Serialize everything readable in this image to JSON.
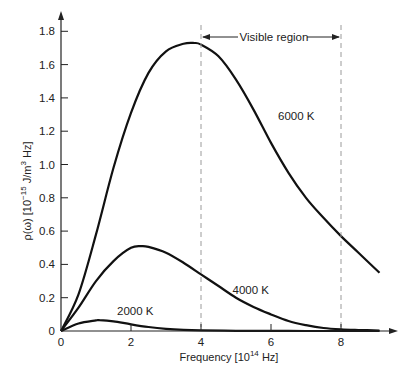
{
  "chart_data": {
    "type": "line",
    "title": "",
    "xlabel": "Frequency [10^14 Hz]",
    "xlabel_main": "Frequency [10",
    "xlabel_exp": "14",
    "xlabel_tail": " Hz]",
    "ylabel": "ρ(ω) [10^-15 J/m^3 Hz]",
    "ylabel_main": "ρ(ω) [10",
    "ylabel_exp": "−15",
    "ylabel_mid": " J/m",
    "ylabel_exp2": "3",
    "ylabel_tail": " Hz]",
    "xlim": [
      0,
      9.5
    ],
    "ylim": [
      0,
      1.85
    ],
    "x_ticks": [
      0,
      2,
      4,
      6,
      8
    ],
    "x_tick_labels": [
      "0",
      "2",
      "4",
      "6",
      "8"
    ],
    "y_ticks": [
      0,
      0.2,
      0.4,
      0.6,
      0.8,
      1.0,
      1.2,
      1.4,
      1.6,
      1.8
    ],
    "y_tick_labels": [
      "0",
      "0.2",
      "0.4",
      "0.6",
      "0.8",
      "1.0",
      "1.2",
      "1.4",
      "1.6",
      "1.8"
    ],
    "grid": false,
    "legend": "inline labels",
    "annotations": [
      {
        "text": "Visible region",
        "x_range": [
          4,
          8
        ],
        "type": "dashed-bracket"
      }
    ],
    "series": [
      {
        "name": "6000 K",
        "label_pos": [
          6.2,
          1.27
        ],
        "x": [
          0,
          0.5,
          1.0,
          1.5,
          2.0,
          2.5,
          3.0,
          3.5,
          3.8,
          4.0,
          4.5,
          5.0,
          5.5,
          6.0,
          6.5,
          7.0,
          7.5,
          8.0,
          8.5,
          9.1
        ],
        "values": [
          0,
          0.22,
          0.58,
          0.98,
          1.31,
          1.55,
          1.68,
          1.725,
          1.73,
          1.72,
          1.65,
          1.51,
          1.33,
          1.13,
          0.95,
          0.8,
          0.68,
          0.57,
          0.47,
          0.35
        ]
      },
      {
        "name": "4000 K",
        "label_pos": [
          4.9,
          0.22
        ],
        "x": [
          0,
          0.5,
          1.0,
          1.5,
          2.0,
          2.3,
          2.5,
          3.0,
          3.5,
          4.0,
          4.5,
          5.0,
          5.5,
          6.0,
          6.5,
          7.0,
          7.5,
          8.0,
          8.5,
          9.1
        ],
        "values": [
          0,
          0.14,
          0.3,
          0.42,
          0.5,
          0.51,
          0.505,
          0.47,
          0.41,
          0.34,
          0.27,
          0.2,
          0.145,
          0.1,
          0.06,
          0.035,
          0.018,
          0.01,
          0.006,
          0.003
        ]
      },
      {
        "name": "2000 K",
        "label_pos": [
          1.6,
          0.095
        ],
        "x": [
          0,
          0.5,
          1.0,
          1.1,
          1.5,
          2.0,
          2.5,
          3.0,
          3.5,
          4.0,
          5.0,
          6.0,
          7.0,
          8.0,
          9.1
        ],
        "values": [
          0,
          0.045,
          0.064,
          0.065,
          0.058,
          0.04,
          0.024,
          0.013,
          0.007,
          0.004,
          0.001,
          0.0005,
          0.0002,
          0.0001,
          0
        ]
      }
    ]
  },
  "colors": {
    "curve": "#111111",
    "axis": "#222222",
    "dashed": "#9a9a9a",
    "text": "#222222"
  }
}
